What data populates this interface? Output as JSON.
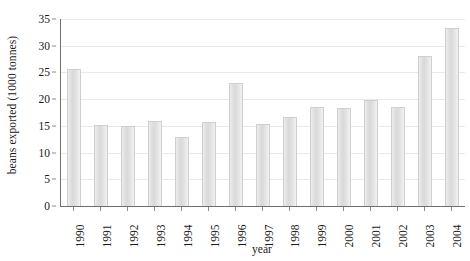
{
  "chart_data": {
    "type": "bar",
    "title": "",
    "xlabel": "year",
    "ylabel": "beans exported (1000 tonnes)",
    "categories": [
      "1990",
      "1991",
      "1992",
      "1993",
      "1994",
      "1995",
      "1996",
      "1997",
      "1998",
      "1999",
      "2000",
      "2001",
      "2002",
      "2003",
      "2004"
    ],
    "values": [
      25.7,
      15.2,
      14.9,
      16.0,
      12.9,
      15.8,
      23.0,
      15.4,
      16.7,
      18.6,
      18.3,
      19.9,
      18.6,
      28.1,
      33.4
    ],
    "ylim": [
      0,
      35
    ],
    "yticks": [
      0,
      5,
      10,
      15,
      20,
      25,
      30,
      35
    ],
    "ytick_labels": [
      "0",
      "5",
      "10",
      "15",
      "20",
      "25",
      "30",
      "35"
    ],
    "grid": true,
    "grid_axis": "y",
    "legend": false,
    "series": [
      {
        "name": "beans exported",
        "values": [
          25.7,
          15.2,
          14.9,
          16.0,
          12.9,
          15.8,
          23.0,
          15.4,
          16.7,
          18.6,
          18.3,
          19.9,
          18.6,
          28.1,
          33.4
        ]
      }
    ],
    "colors": {
      "bar_fill": "#e0e0e0",
      "bar_edge": "#cfcfcf",
      "axis": "#6f6f6f",
      "grid": "#e9e9e9",
      "text": "#1a1a1a",
      "background": "#ffffff"
    }
  }
}
